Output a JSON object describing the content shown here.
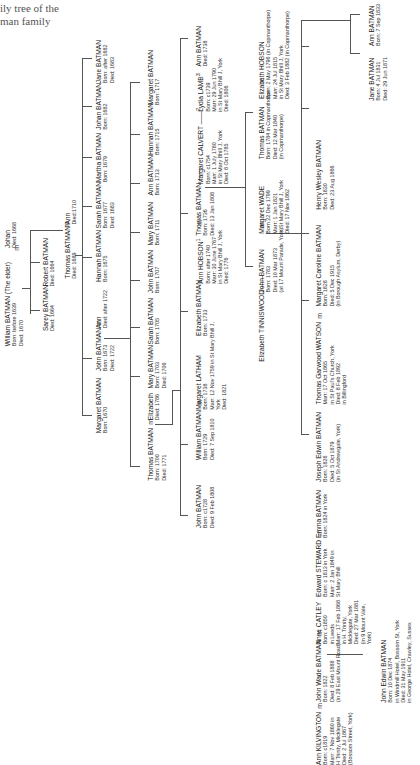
{
  "title": {
    "line1": "ily tree of the",
    "line2": "man family"
  },
  "marriage_symbol": "m",
  "people": {
    "william_elder": {
      "name": "William BATMAN (The elder)",
      "l1": "Born: before 1639",
      "l2": "Died: 1670"
    },
    "johan_w": {
      "name": "Johan",
      "l1": "Died: 1668"
    },
    "sarey": {
      "name": "Sarey BATMAN",
      "l1": "Died: 1664"
    },
    "robert": {
      "name": "Robert BATMAN",
      "l1": "Died: 1664"
    },
    "thomas_1689": {
      "name": "Thomas BATMAN",
      "l1": "Died: 1689"
    },
    "ann_1710": {
      "name": "Ann",
      "l1": "Died:1710"
    },
    "margaret_1670": {
      "name": "Margaret BATMAN",
      "l1": "Born: 1670"
    },
    "john_1673": {
      "name": "John BATMAN",
      "l1": "Born: 1673",
      "l2": "Died: 1722"
    },
    "ann_1722": {
      "name": "Ann",
      "l1": "Died: after 1722"
    },
    "hannah_1675": {
      "name": "Hannah BATMAN",
      "l1": "Born: 1675"
    },
    "sarah_1677": {
      "name": "Sarah BATMAN",
      "l1": "Born: 1677",
      "l2": "Died: 1683"
    },
    "martha_1679": {
      "name": "Martha BATMAN",
      "l1": "Born: 1679"
    },
    "johan_1682": {
      "name": "Johan BATMAN",
      "l1": "Born: 1682"
    },
    "jane_1682": {
      "name": "Jane BATMAN",
      "l1": "Born: after 1682",
      "l2": "Died: 1683"
    },
    "thomas_1700": {
      "name": "Thomas BATMAN",
      "l1": "Born: 1700",
      "l2": "Died: 1771"
    },
    "elizabeth_1786": {
      "name": "Elizabeth",
      "l1": "Died: 1786"
    },
    "mary_1703": {
      "name": "Mary BATMAN",
      "l1": "Born: 1703",
      "l2": "Died: 1706"
    },
    "sarah_1705": {
      "name": "Sarah BATMAN",
      "l1": "Born: 1705"
    },
    "john_1707": {
      "name": "John BATMAN",
      "l1": "Born: 1707"
    },
    "mary_1711": {
      "name": "Mary BATMAN",
      "l1": "Born: 1711"
    },
    "ann_1713": {
      "name": "Ann BATMAN",
      "l1": "Born: 1713"
    },
    "hannah_1715": {
      "name": "Hannah BATMAN",
      "l1": "Born: 1715"
    },
    "margaret_1717": {
      "name": "Margaret BATMAN",
      "l1": "Born: 1717"
    },
    "john_c1728": {
      "name": "John BATMAN",
      "l1": "Born: c1728",
      "l2": "Died: 9 Feb 1808"
    },
    "william_1729": {
      "name": "William BATMAN",
      "l1": "Born: 1729",
      "l2": "Died: 7 Sep 1810"
    },
    "margaret_latham": {
      "name": "Margaret LATHAM",
      "l1": "Born: 1738",
      "l2": "Marr: 12 Nov 1759 in St Mary Bhill J,",
      "l3": "York",
      "l4": "Died: 1821"
    },
    "elizabeth_1733": {
      "name": "Elizabeth BATMAN",
      "l1": "Born: 1733"
    },
    "ann_hobson": {
      "name": "Ann HOBSON",
      "sup": "1",
      "l1": "Born: after 1740",
      "l2": "Marr: 30 June 1767",
      "l3": "in St Mary Bhill J, York",
      "l4": "Died: 1776"
    },
    "thomas_1736": {
      "name": "Thomas BATMAN ——",
      "l1": "Born: 1736",
      "l2": "Died: 13 Jan 1808"
    },
    "margaret_calvert": {
      "name": "Margaret CALVERT ——",
      "sup": "2",
      "l1": "Born: c1754",
      "l2": "Marr: 1 July 1780",
      "l3": "in St Mary Bhill J, York",
      "l4": "Died: 8 Oct 1785"
    },
    "lydia_lamb": {
      "name": "Lydia LAMB",
      "sup": "3",
      "l1": "Born: c1739",
      "l2": "Marr: 29 Jun 1790",
      "l3": "in St Mary Bhill J, York",
      "l4": "Died: 1806"
    },
    "ann_1738": {
      "name": "Ann BATMAN",
      "l1": "Died: 1738"
    },
    "elizabeth_tinniswood": {
      "name": "Elizabeth TINNISWOOD ——"
    },
    "john_1783": {
      "name": "John BATMAN",
      "l1": "Born: 1783",
      "l2": "Died: 10 Mar 1873",
      "l3": "(at 17 Mount Parade, York)"
    },
    "margaret_wade": {
      "name": "Margaret WADE",
      "l1": "Born 22 Dec 1799",
      "l2": "Marr: 1 Jan 1821",
      "l3": "in St Mary Bhill J, York",
      "l4": "Died: 17 Nov 1862"
    },
    "thomas_1784": {
      "name": "Thomas BATMAN",
      "l1": "Born: 1784 in Copmanthorpe",
      "l2": "Died: 12 Mar 1840",
      "l3": "(in Copmanthorpe)"
    },
    "elizabeth_hobson": {
      "name": "Elizabeth HOBSON",
      "l1": "Born: 2 May 1796 (in Copmanthorpe)",
      "l2": "Marr: 24 Jul 1815",
      "l3": "in St Mary Bhill J, York",
      "l4": "Died: 3 Feb 1882 (in Copmanthorpe)"
    },
    "ann_kilvington": {
      "name": "Ann KILVINGTON",
      "l1": "Born: c1819",
      "l2": "Marr: 7 Nov 1860 in",
      "l3": "H Trinity, Micklegate",
      "l4": "Died: 2 Jul 1867",
      "l5": "(Bossom Street, York)"
    },
    "john_wade": {
      "name": "John Wade BATMAN",
      "l1": "Born: 1822",
      "l2": "Died: 8 Feb 1888",
      "l3": "(in 29 East Mount Road)"
    },
    "anne_catley": {
      "name": "Anne CATLEY",
      "l1": "Born: c1850",
      "l2": "in Leeds",
      "l3": "Marr: 17 Feb 1868",
      "l4": "in H. Trinity,",
      "l5": "Micklegate, York",
      "l6": "Died: 27 Mar 1881",
      "l7": "(in 9 Mount Vale,",
      "l8": "York)"
    },
    "edward_steward": {
      "name": "Edward STEWARD",
      "l1": "Born: c 1813 in York",
      "l2": "Marr: 2 Jan 1849 in",
      "l3": "St Mary Bhill"
    },
    "emma": {
      "name": "Emma BATMAN",
      "l1": "Born: 1824 in York"
    },
    "joseph_edwin": {
      "name": "Joseph Edwin BATMAN",
      "l1": "Born: 1826",
      "l2": "Died: 5 Oct 1879",
      "l3": "(in St Andrewgate, York)"
    },
    "thomas_watson": {
      "name": "Thomas Garwood WATSON",
      "l1": "Marr: 17 Oct 1865",
      "l2": "in St Paul's Church, York",
      "l3": "Died: 8 Feb 1892",
      "l4": "in Billingford"
    },
    "margaret_caroline": {
      "name": "Margaret Caroline BATMAN",
      "l1": "Born: 1828",
      "l2": "Died: 5 Dec 1915",
      "l3": "(in Borough Asylum, Derby)"
    },
    "henry_wesley": {
      "name": "Henry Wesley BATMAN",
      "l1": "Born: 1830",
      "l2": "Died: 23 Aug 1866"
    },
    "john_edwin": {
      "name": "John Edwin BATMAN",
      "l1": "Born: 10 Dec 1874",
      "l2": "in Windmill Hotel, Bossom St, York",
      "l3": "Died: 31 May 1911",
      "l4": "in George Hotel, Crawley, Sussex"
    },
    "jane_1831": {
      "name": "Jane BATMAN",
      "l1": "Born: 4 Jul 1831",
      "l2": "Died: 29 Jun 1871"
    },
    "ann_1833": {
      "name": "Ann BATMAN",
      "l1": "Born: 7 Sep 1833"
    }
  }
}
